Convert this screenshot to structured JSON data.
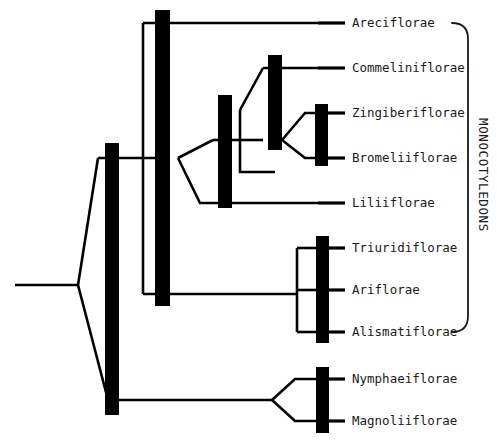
{
  "diagram": {
    "type": "cladogram",
    "title": "",
    "background_color": "#ffffff",
    "line_color": "#000000",
    "text_color": "#1a1a1a",
    "clade_bar_color": "#000000"
  },
  "taxa": [
    {
      "label": "Areciflorae",
      "y": 23,
      "tick_x1": 318,
      "tick_x2": 345,
      "label_x": 352
    },
    {
      "label": "Commeliniflorae",
      "y": 68,
      "tick_x1": 318,
      "tick_x2": 345,
      "label_x": 352
    },
    {
      "label": "Zingiberiflorae",
      "y": 113,
      "tick_x1": 318,
      "tick_x2": 345,
      "label_x": 352
    },
    {
      "label": "Bromeliiflorae",
      "y": 158,
      "tick_x1": 318,
      "tick_x2": 345,
      "label_x": 352
    },
    {
      "label": "Liliiflorae",
      "y": 203,
      "tick_x1": 318,
      "tick_x2": 345,
      "label_x": 352
    },
    {
      "label": "Triuridiflorae",
      "y": 248,
      "tick_x1": 318,
      "tick_x2": 345,
      "label_x": 352
    },
    {
      "label": "Ariflorae",
      "y": 290,
      "tick_x1": 318,
      "tick_x2": 345,
      "label_x": 352
    },
    {
      "label": "Alismatiflorae",
      "y": 332,
      "tick_x1": 318,
      "tick_x2": 345,
      "label_x": 352
    },
    {
      "label": "Nymphaeiflorae",
      "y": 379,
      "tick_x1": 318,
      "tick_x2": 345,
      "label_x": 352
    },
    {
      "label": "Magnoliiflorae",
      "y": 421,
      "tick_x1": 318,
      "tick_x2": 345,
      "label_x": 352
    }
  ],
  "group_bracket": {
    "label": "MONOCOTYLEDONS",
    "label_x": 479,
    "label_y": 175,
    "top_y": 23,
    "bottom_y": 332,
    "x": 468
  },
  "clade_bars": [
    {
      "name": "monocot-stem-bar",
      "x": 155,
      "y": 10,
      "width": 15,
      "height": 296
    },
    {
      "name": "magnoliid-stem-bar",
      "x": 105,
      "y": 143,
      "width": 14,
      "height": 272
    },
    {
      "name": "lilioid-bar",
      "x": 218,
      "y": 95,
      "width": 14,
      "height": 113
    },
    {
      "name": "commelinoid-bar",
      "x": 268,
      "y": 55,
      "width": 14,
      "height": 95
    },
    {
      "name": "zingiber-bromelia-bar",
      "x": 315,
      "y": 104,
      "width": 13,
      "height": 62
    },
    {
      "name": "alismatid-bar",
      "x": 316,
      "y": 236,
      "width": 13,
      "height": 107
    },
    {
      "name": "nymphaeid-bar",
      "x": 316,
      "y": 367,
      "width": 13,
      "height": 66
    }
  ],
  "nodes": {
    "root_x": 15,
    "root_y": 285,
    "monocot_node_x": 78,
    "monocot_node_y": 285,
    "magnoliid_node_x": 270,
    "magnoliid_node_y": 400
  },
  "branches": [
    {
      "name": "root-stem",
      "d": "M 15 285 L 78 285"
    },
    {
      "name": "root-to-monocots",
      "d": "M 78 285 L 98 158"
    },
    {
      "name": "root-to-magnoliids",
      "d": "M 78 285 L 108 400"
    },
    {
      "name": "monocot-backbone",
      "d": "M 98 158 L 163 158"
    },
    {
      "name": "monocot-node-to-areci",
      "d": "M 143 23 L 318 23"
    },
    {
      "name": "monocot-node-vertical",
      "d": "M 143 23 L 143 294"
    },
    {
      "name": "monocot-node-to-alismat",
      "d": "M 143 294 L 297 294"
    },
    {
      "name": "lilioid-stem",
      "d": "M 178 158 L 213 140"
    },
    {
      "name": "lilioid-crown-top",
      "d": "M 213 140 L 240 140"
    },
    {
      "name": "lilioid-to-lilii",
      "d": "M 178 158 L 200 203 L 318 203"
    },
    {
      "name": "commelinoid-stem",
      "d": "M 240 110 L 263 68"
    },
    {
      "name": "commelinoid-to-commeli",
      "d": "M 263 68 L 318 68"
    },
    {
      "name": "commelinoid-lower",
      "d": "M 240 140 L 263 140"
    },
    {
      "name": "commeli-branch-down",
      "d": "M 240 110 L 240 172 L 275 172"
    },
    {
      "name": "zingiber-stem",
      "d": "M 282 140 L 305 113 L 318 113"
    },
    {
      "name": "bromelia-stem",
      "d": "M 282 140 L 305 158 L 318 158"
    },
    {
      "name": "alismatid-bracket",
      "d": "M 297 248 L 297 332"
    },
    {
      "name": "alismatid-top-arm",
      "d": "M 297 248 L 318 248"
    },
    {
      "name": "alismatid-bottom-arm",
      "d": "M 297 332 L 318 332"
    },
    {
      "name": "alismatid-mid-arm",
      "d": "M 297 290 L 318 290"
    },
    {
      "name": "magnoliid-backbone",
      "d": "M 108 400 L 272 400"
    },
    {
      "name": "nymphaei-stem",
      "d": "M 272 400 L 295 379 L 318 379"
    },
    {
      "name": "magnolii-stem",
      "d": "M 272 400 L 295 421 L 318 421"
    }
  ]
}
